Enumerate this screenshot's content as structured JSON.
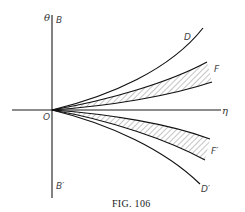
{
  "figure": {
    "caption": "Fig. 106",
    "caption_small_caps": "FIG. 106",
    "axes": {
      "vertical_label": "θ",
      "horizontal_label": "η",
      "origin_label": "O",
      "vertical_top_label": "B",
      "vertical_bottom_label": "B′"
    },
    "curves": [
      {
        "id": "D",
        "label": "D",
        "description": "upper outer curve rising from origin"
      },
      {
        "id": "F",
        "label": "F",
        "description": "upper hatched band between two curves"
      },
      {
        "id": "F_prime",
        "label": "F′",
        "description": "lower hatched band between two curves"
      },
      {
        "id": "D_prime",
        "label": "D′",
        "description": "lower outer curve descending from origin"
      }
    ],
    "colors": {
      "line": "#111111",
      "hatch": "#555555",
      "background": "#ffffff"
    }
  }
}
